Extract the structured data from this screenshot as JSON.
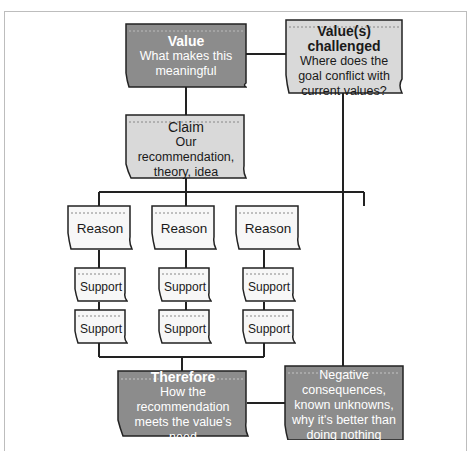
{
  "diagram": {
    "colors": {
      "dark_fill": "#8c8c8c",
      "light_fill": "#d9d9d9",
      "white_fill": "#f7f7f7",
      "stroke": "#222222",
      "dashed": "#888888"
    },
    "value": {
      "title": "Value",
      "subtitle": "What makes this meaningful"
    },
    "value_challenged": {
      "title": "Value(s) challenged",
      "subtitle": "Where does the goal conflict with current values?"
    },
    "claim": {
      "title": "Claim",
      "subtitle": "Our recommendation, theory, idea"
    },
    "reasons": [
      {
        "label": "Reason",
        "supports": [
          "Support",
          "Support"
        ]
      },
      {
        "label": "Reason",
        "supports": [
          "Support",
          "Support"
        ]
      },
      {
        "label": "Reason",
        "supports": [
          "Support",
          "Support"
        ]
      }
    ],
    "therefore": {
      "title": "Therefore",
      "subtitle": "How the recommendation meets the value's need"
    },
    "negatives": {
      "text": "Negative consequences, known unknowns, why it's better than doing nothing"
    }
  }
}
